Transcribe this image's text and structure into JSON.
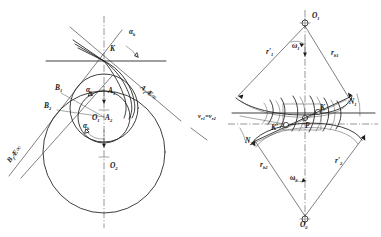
{
  "figure": {
    "ink_color": "#1d1d1d",
    "background_color": "#ffffff",
    "top_artifact_text": ""
  },
  "left_diagram": {
    "name": "limiting-involute-profiles",
    "labels": {
      "K": "K",
      "A1": "A",
      "A1_sub": "1",
      "A2": "A",
      "A2_sub": "2",
      "B1": "B",
      "B1_sub": "1",
      "B2": "B",
      "B2_sub": "2",
      "O1": "O",
      "O1_sub": "1",
      "O2": "O",
      "O2_sub": "2",
      "alpha_top": "α",
      "alpha_top_sub": "k",
      "alpha_mid": "α",
      "alpha_mid_sub": "k",
      "alpha_low": "α",
      "alpha_low_sub": "k",
      "line_right": "A₁⇒∞",
      "line_left": "B₁⇒∞"
    },
    "line_right_parts": {
      "base": "A",
      "sub": "1",
      "tail": "Æ∞"
    },
    "line_left_parts": {
      "base": "B",
      "sub": "1",
      "tail": "Æ∞"
    }
  },
  "right_diagram": {
    "name": "conjugate-action-pair",
    "labels": {
      "O1": "O",
      "O1_sub": "1",
      "O2": "O",
      "O2_sub": "2",
      "K": "K",
      "K_prime": "K′",
      "P": "P",
      "N1": "N",
      "N1_sub": "1",
      "N2": "N",
      "N2_sub": "2",
      "omega1": "ω",
      "omega1_sub": "1",
      "omega2": "ω",
      "omega2_sub": "2",
      "r1_prime": "r′",
      "r1_prime_sub": "1",
      "r2_prime": "r′",
      "r2_prime_sub": "2",
      "rb1": "r",
      "rb1_sub": "b1",
      "rb2": "r",
      "rb2_sub": "b2",
      "velocity_eq": "v",
      "velocity_eq_sub1": "r1",
      "velocity_eq_mid": "=v",
      "velocity_eq_sub2": "r2"
    }
  }
}
